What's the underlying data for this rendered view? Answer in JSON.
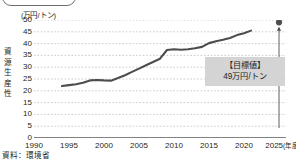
{
  "figure": {
    "unit_label": "(万円/トン)",
    "y_axis_title_chars": [
      "資",
      "源",
      "生",
      "産",
      "性"
    ],
    "source_note": "資料：環境省",
    "target_box": {
      "line1": "【目標値】",
      "line2": "49万円/トン"
    },
    "colors": {
      "line": "#4d4d4d",
      "grid": "#bfbfbf",
      "axis": "#595959",
      "box_background": "#d4d4d4",
      "text": "#231f20",
      "marker": "#4d4d4d"
    }
  },
  "chart_data": {
    "type": "line",
    "title": "",
    "xlabel": "(年度)",
    "ylabel": "資源生産性",
    "unit": "万円/トン",
    "xlim": [
      1990,
      2026
    ],
    "ylim": [
      0,
      50
    ],
    "y_ticks": [
      0,
      5,
      10,
      15,
      20,
      25,
      30,
      35,
      40,
      45,
      50
    ],
    "x_ticks": [
      1990,
      1995,
      2000,
      2005,
      2010,
      2015,
      2020,
      2025
    ],
    "x_tick_labels": [
      "1990",
      "1995",
      "2000",
      "2005",
      "2010",
      "2015",
      "2020",
      "2025"
    ],
    "x_tick_suffix": "(年度)",
    "grid": "horizontal-dotted",
    "legend": "none",
    "series": [
      {
        "name": "資源生産性",
        "x": [
          1994,
          1995,
          1996,
          1997,
          1998,
          1999,
          2000,
          2001,
          2002,
          2003,
          2004,
          2005,
          2006,
          2007,
          2008,
          2009,
          2010,
          2011,
          2012,
          2013,
          2014,
          2015,
          2016,
          2017,
          2018,
          2019,
          2020,
          2021
        ],
        "values": [
          22.0,
          22.4,
          22.8,
          23.4,
          24.4,
          24.6,
          24.4,
          24.3,
          25.4,
          26.6,
          28.0,
          29.4,
          30.8,
          32.2,
          33.6,
          37.3,
          37.6,
          37.4,
          37.6,
          38.0,
          38.6,
          40.2,
          41.0,
          41.6,
          42.4,
          43.6,
          44.4,
          45.5
        ]
      }
    ],
    "annotations": [
      {
        "name": "target-marker",
        "x": 2025,
        "y": 49,
        "label": "【目標値】 49万円/トン",
        "marker": "filled-circle",
        "connector": "arrow-up"
      }
    ]
  }
}
